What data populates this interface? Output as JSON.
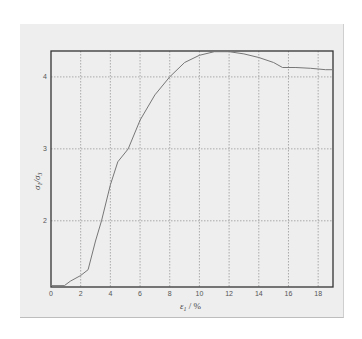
{
  "chart_data": {
    "type": "line",
    "title": "",
    "xlabel": "ε1 / %",
    "ylabel": "σ1/σ3",
    "xlim": [
      0,
      19
    ],
    "ylim": [
      1.08,
      4.36
    ],
    "grid": true,
    "x_ticks": [
      0,
      2,
      4,
      6,
      8,
      10,
      12,
      14,
      16,
      18
    ],
    "y_ticks": [
      2,
      3,
      4
    ],
    "series": [
      {
        "name": "σ1/σ3 vs ε1",
        "color": "#777777",
        "x": [
          0,
          0.9,
          1.3,
          2.0,
          2.5,
          3.0,
          3.4,
          4.0,
          4.5,
          5.2,
          6.0,
          7.0,
          8.0,
          9.0,
          10.0,
          11.0,
          12.0,
          13.0,
          14.0,
          15.0,
          15.6,
          16.5,
          17.5,
          18.5,
          19.0
        ],
        "y": [
          1.1,
          1.1,
          1.16,
          1.24,
          1.32,
          1.72,
          2.0,
          2.5,
          2.82,
          3.0,
          3.4,
          3.75,
          4.0,
          4.2,
          4.3,
          4.35,
          4.35,
          4.32,
          4.27,
          4.2,
          4.13,
          4.13,
          4.12,
          4.1,
          4.1
        ]
      }
    ]
  },
  "labels": {
    "xlabel_main": "ε",
    "xlabel_sub": "1",
    "xlabel_unit": " / %",
    "ylabel_main": "σ",
    "ylabel_sub1": "1",
    "ylabel_mid": "/σ",
    "ylabel_sub2": "3"
  }
}
